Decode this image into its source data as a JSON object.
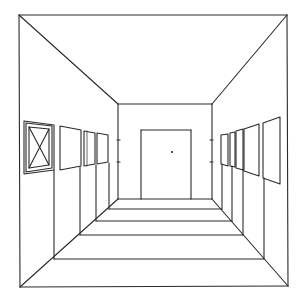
{
  "figure": {
    "colors": {
      "background": "#ffffff",
      "ink": "#2a2a2a"
    },
    "outer_frame": {
      "x1": 19,
      "y1": 15,
      "x2": 288,
      "y2": 287
    },
    "back_wall": {
      "x1": 118,
      "y1": 104,
      "x2": 212,
      "y2": 199
    },
    "door": {
      "x1": 141,
      "y1": 130,
      "x2": 191,
      "y2": 199,
      "knob": [
        172,
        152
      ]
    },
    "wall_ticks": {
      "left": [
        140,
        162
      ],
      "right": [
        140,
        162
      ]
    },
    "floor_lines": [
      {
        "y": 209,
        "xl": 109,
        "xr": 222
      },
      {
        "y": 221,
        "xl": 96,
        "xr": 232
      },
      {
        "y": 235,
        "xl": 80,
        "xr": 243
      },
      {
        "y": 259,
        "xl": 54,
        "xr": 264
      },
      {
        "y": 287,
        "xl": 20,
        "xr": 288
      }
    ],
    "left_paintings": {
      "count": 4,
      "description": "Row of framed pictures on left wall; first has an X inside an inner frame"
    },
    "right_paintings": {
      "count": 5,
      "description": "Row of framed pictures on right wall receding toward back wall"
    }
  }
}
